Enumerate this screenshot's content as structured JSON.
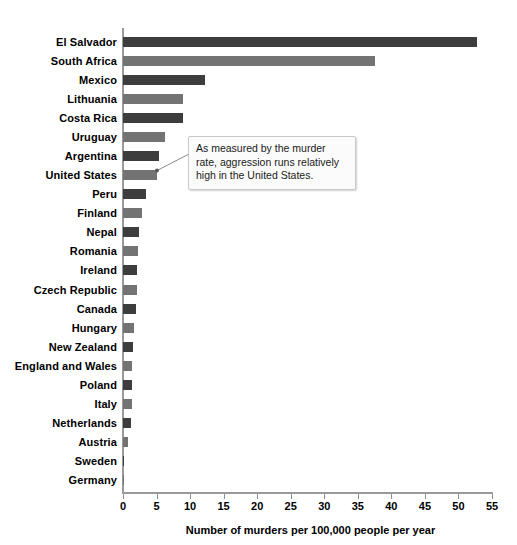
{
  "chart_data": {
    "type": "bar",
    "orientation": "horizontal",
    "title": "",
    "xlabel": "Number of murders per 100,000 people per year",
    "ylabel": "",
    "xlim": [
      0,
      55
    ],
    "xticks": [
      0,
      5,
      10,
      15,
      20,
      25,
      30,
      35,
      40,
      45,
      50,
      55
    ],
    "grid": false,
    "legend": "none",
    "categories": [
      "El Salvador",
      "South Africa",
      "Mexico",
      "Lithuania",
      "Costa Rica",
      "Uruguay",
      "Argentina",
      "United States",
      "Peru",
      "Finland",
      "Nepal",
      "Romania",
      "Ireland",
      "Czech Republic",
      "Canada",
      "Hungary",
      "New Zealand",
      "England and Wales",
      "Poland",
      "Italy",
      "Netherlands",
      "Austria",
      "Sweden",
      "Germany"
    ],
    "values": [
      52.8,
      37.6,
      12.2,
      9.0,
      8.9,
      6.2,
      5.3,
      5.0,
      3.4,
      2.8,
      2.4,
      2.3,
      2.1,
      2.1,
      1.9,
      1.6,
      1.5,
      1.4,
      1.4,
      1.3,
      1.2,
      0.8,
      0.15,
      0.1
    ],
    "bar_colors": [
      "#3d3d3d",
      "#737373",
      "#3d3d3d",
      "#737373",
      "#3d3d3d",
      "#737373",
      "#3d3d3d",
      "#737373",
      "#3d3d3d",
      "#737373",
      "#3d3d3d",
      "#737373",
      "#3d3d3d",
      "#737373",
      "#3d3d3d",
      "#737373",
      "#3d3d3d",
      "#737373",
      "#3d3d3d",
      "#737373",
      "#3d3d3d",
      "#737373",
      "#3d3d3d",
      "#737373"
    ],
    "annotations": [
      {
        "text": "As measured by the murder rate, aggression runs relatively high in the United States.",
        "points_to": "United States"
      }
    ]
  },
  "colors": {
    "bar_dark": "#3d3d3d",
    "bar_light": "#737373",
    "axis": "#9a9a9a",
    "callout_bg": "#fbfbfb",
    "callout_border": "#c9c9c9",
    "text": "#000000"
  }
}
